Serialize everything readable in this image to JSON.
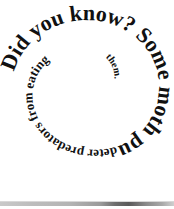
{
  "page": {
    "background_color": "#ffffff",
    "width": 174,
    "height": 209
  },
  "figure": {
    "name": "did-you-know-spiral",
    "kind": "spiral-text-graphic",
    "text_color": "#111111",
    "full_text": "Did you know? Some moth pupae produce squeaks to deter predators from eating them.",
    "segments": [
      {
        "id": "seg-1",
        "text": "Did you know? Some moth pupae produce squeaks to"
      },
      {
        "id": "seg-2",
        "text": "deter predators from eating"
      },
      {
        "id": "seg-3",
        "text": "them."
      }
    ],
    "heading": "Did you know?",
    "fact": "Some moth pupae produce squeaks to deter predators from eating them."
  },
  "bottom_strip": {
    "name": "bottom-gradient-strip",
    "start_color": "#c9c9c9",
    "mid_color": "#5a5a5a",
    "end_color": "#cfcfcf"
  }
}
